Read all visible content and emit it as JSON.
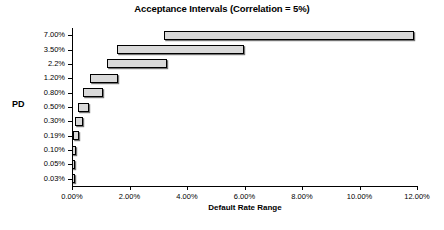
{
  "chart_data": {
    "type": "bar",
    "orientation": "horizontal",
    "subtype": "floating-range-bar",
    "title": "Acceptance Intervals (Correlation = 5%)",
    "xlabel": "Default Rate Range",
    "ylabel": "PD",
    "xlim": [
      0,
      12
    ],
    "xunit": "%",
    "grid": false,
    "legend": null,
    "xticks": [
      {
        "value": 0,
        "label": "0.00%"
      },
      {
        "value": 2,
        "label": "2.00%"
      },
      {
        "value": 4,
        "label": "4.00%"
      },
      {
        "value": 6,
        "label": "6.00%"
      },
      {
        "value": 8,
        "label": "8.00%"
      },
      {
        "value": 10,
        "label": "10.00%"
      },
      {
        "value": 12,
        "label": "12.00%"
      }
    ],
    "categories": [
      "7.00%",
      "3.50%",
      "2.2%",
      "1.20%",
      "0.80%",
      "0.50%",
      "0.30%",
      "0.19%",
      "0.10%",
      "0.05%",
      "0.03%"
    ],
    "bars": [
      {
        "category": "7.00%",
        "start": 3.2,
        "end": 11.9
      },
      {
        "category": "3.50%",
        "start": 1.57,
        "end": 5.98
      },
      {
        "category": "2.2%",
        "start": 1.22,
        "end": 3.3
      },
      {
        "category": "1.20%",
        "start": 0.63,
        "end": 1.6
      },
      {
        "category": "0.80%",
        "start": 0.38,
        "end": 1.08
      },
      {
        "category": "0.50%",
        "start": 0.21,
        "end": 0.59
      },
      {
        "category": "0.30%",
        "start": 0.09,
        "end": 0.38
      },
      {
        "category": "0.19%",
        "start": 0.04,
        "end": 0.24
      },
      {
        "category": "0.10%",
        "start": 0.01,
        "end": 0.15
      },
      {
        "category": "0.05%",
        "start": 0.0,
        "end": 0.09
      },
      {
        "category": "0.03%",
        "start": 0.0,
        "end": 0.05
      }
    ],
    "colors": {
      "bar_fill": "#d9d9d9",
      "bar_border": "#000000",
      "axis": "#000000",
      "text": "#000000",
      "background": "#ffffff"
    }
  }
}
